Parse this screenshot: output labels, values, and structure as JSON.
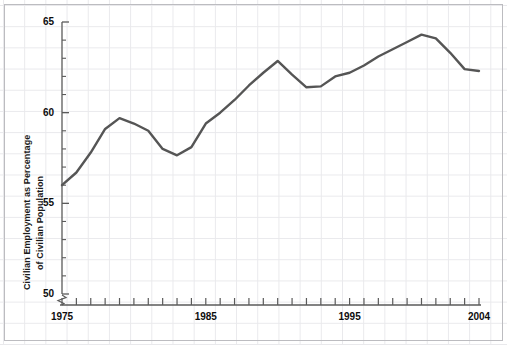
{
  "chart_data": {
    "type": "line",
    "title": "",
    "xlabel": "",
    "ylabel": "Civilian Employment as Percentage of Civilian Population",
    "ylabel_lines": [
      "Civilian Employment as Percentage",
      "of Civilian Population"
    ],
    "xlim": [
      1975,
      2004
    ],
    "ylim": [
      50,
      65
    ],
    "y_axis_break": true,
    "grid": true,
    "legend": null,
    "x_tick_labels": [
      "1975",
      "1985",
      "1995",
      "2004"
    ],
    "x_tick_values": [
      1975,
      1985,
      1995,
      2004
    ],
    "x_minor_ticks_every": 1,
    "y_tick_labels": [
      "50",
      "55",
      "60",
      "65"
    ],
    "y_tick_values": [
      50,
      55,
      60,
      65
    ],
    "y_minor_ticks_every": 1,
    "line_color": "#555555",
    "line_width": 2.4,
    "grid_color": "#e9e9ec",
    "axis_color": "#5a5a5a",
    "series": [
      {
        "name": "Civilian Employment as Percentage of Civilian Population",
        "x": [
          1975,
          1976,
          1977,
          1978,
          1979,
          1980,
          1981,
          1982,
          1983,
          1984,
          1985,
          1986,
          1987,
          1988,
          1989,
          1990,
          1991,
          1992,
          1993,
          1994,
          1995,
          1996,
          1997,
          1998,
          1999,
          2000,
          2001,
          2002,
          2003,
          2004
        ],
        "values": [
          56.0,
          56.7,
          57.8,
          59.1,
          59.7,
          59.4,
          59.0,
          58.0,
          57.65,
          58.1,
          59.4,
          60.0,
          60.7,
          61.5,
          62.2,
          62.85,
          62.1,
          61.4,
          61.45,
          62.0,
          62.2,
          62.6,
          63.1,
          63.5,
          63.9,
          64.3,
          64.1,
          63.3,
          62.4,
          62.3
        ]
      }
    ]
  }
}
